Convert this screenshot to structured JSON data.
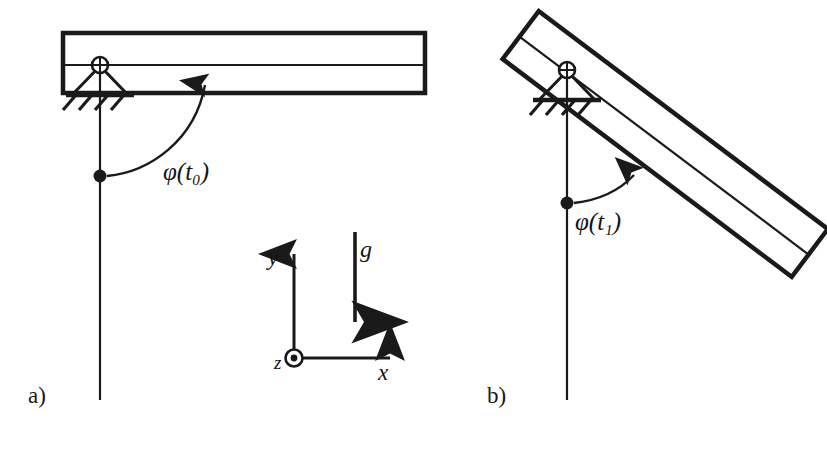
{
  "figure": {
    "type": "engineering-diagram",
    "background_color": "#ffffff",
    "ink_color": "#1a1a1a"
  },
  "panels": [
    {
      "id": "a",
      "label": "a)",
      "label_pos": {
        "x": 28,
        "y": 386
      },
      "angle_label": "φ(t₀)",
      "angle_symbol": "φ",
      "angle_time": "t",
      "angle_subscript": "0",
      "angle_label_pos": {
        "x": 163,
        "y": 163
      },
      "beam_angle_deg": 0,
      "description": "Beam horizontal, angle phi measured from vertical plumb line"
    },
    {
      "id": "b",
      "label": "b)",
      "label_pos": {
        "x": 487,
        "y": 386
      },
      "angle_label": "φ(t₁)",
      "angle_symbol": "φ",
      "angle_time": "t",
      "angle_subscript": "1",
      "angle_label_pos": {
        "x": 575,
        "y": 213
      },
      "beam_angle_deg": 37,
      "description": "Beam rotated clockwise by phi, angle measured from vertical plumb line"
    }
  ],
  "annotations": {
    "gravity": {
      "symbol": "g",
      "label_pos": {
        "x": 360,
        "y": 238
      },
      "direction": "down",
      "arrow_from": {
        "x": 355,
        "y": 232
      },
      "arrow_to": {
        "x": 355,
        "y": 330
      }
    },
    "coordinate_system": {
      "origin": {
        "x": 294,
        "y": 358
      },
      "axes": [
        {
          "name": "y",
          "label": "y",
          "direction": "up",
          "label_pos": {
            "x": 270,
            "y": 248
          },
          "tip": {
            "x": 294,
            "y": 243
          }
        },
        {
          "name": "x",
          "label": "x",
          "direction": "right",
          "label_pos": {
            "x": 380,
            "y": 363
          },
          "tip": {
            "x": 400,
            "y": 358
          }
        },
        {
          "name": "z",
          "label": "z",
          "direction": "out-of-page",
          "label_pos": {
            "x": 276,
            "y": 355
          },
          "glyph": "circle-dot"
        }
      ]
    }
  },
  "elements": {
    "beam_a": {
      "name": "beam",
      "corners": [
        [
          63,
          33
        ],
        [
          425,
          33
        ],
        [
          425,
          93
        ],
        [
          63,
          93
        ]
      ],
      "centerline_y": 65,
      "stroke_width": 4.5
    },
    "beam_b": {
      "name": "beam-rotated",
      "pivot": {
        "x": 567,
        "y": 70
      },
      "rotation_deg": 37,
      "length": 362,
      "thickness": 60,
      "overhang": 58
    },
    "support_a": {
      "name": "pin-support",
      "pivot": {
        "x": 100,
        "y": 65
      },
      "triangle_half_width": 28,
      "triangle_height": 30,
      "baseline_y": 95,
      "hatch_count": 4
    },
    "support_b": {
      "name": "pin-support",
      "pivot": {
        "x": 567,
        "y": 70
      },
      "triangle_half_width": 28,
      "triangle_height": 30,
      "baseline_y": 100,
      "hatch_count": 4
    },
    "plumb_line_a": {
      "from": {
        "x": 100,
        "y": 95
      },
      "to": {
        "x": 100,
        "y": 400
      }
    },
    "plumb_line_b": {
      "from": {
        "x": 567,
        "y": 100
      },
      "to": {
        "x": 567,
        "y": 400
      }
    },
    "pivot_dot_a": {
      "x": 100,
      "y": 176,
      "r": 6
    },
    "pivot_dot_b": {
      "x": 567,
      "y": 203,
      "r": 6
    }
  }
}
